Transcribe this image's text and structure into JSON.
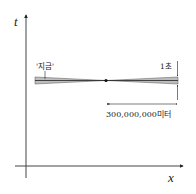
{
  "diagram": {
    "axes": {
      "y_label": "t",
      "x_label": "x"
    },
    "labels": {
      "now": "'지금'",
      "time_span": "1초",
      "distance": "300,000,000미터"
    },
    "colors": {
      "band_fill": "#bdbdbd",
      "line": "#222222"
    }
  }
}
